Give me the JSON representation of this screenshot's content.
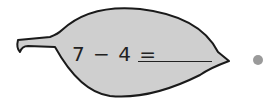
{
  "problem": {
    "expression": "7 − 4 =",
    "answer": ""
  },
  "colors": {
    "leaf_fill": "#cfcfcf",
    "leaf_outline": "#1a1a1a",
    "dot": "#9a9a9a"
  },
  "icons": {
    "leaf": "leaf-shape",
    "bullet": "circle-dot"
  }
}
